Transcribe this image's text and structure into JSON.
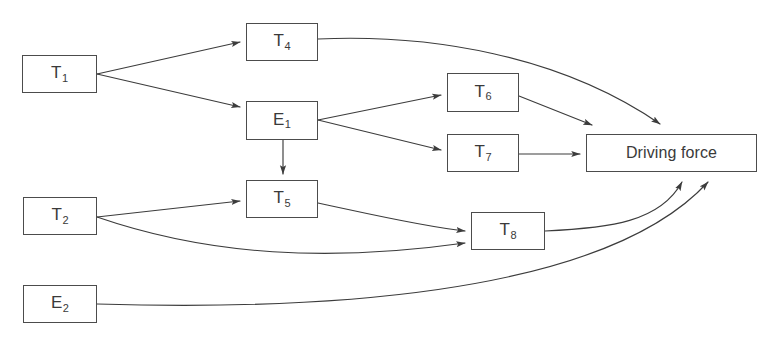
{
  "diagram": {
    "background_color": "#ffffff",
    "line_color": "#3c3c3c",
    "box_border_color": "#4c4c4c",
    "text_color": "#3a3a3a",
    "nodes": [
      {
        "id": "T1",
        "base": "T",
        "sub": "1",
        "label": "T1",
        "x": 22,
        "y": 55,
        "w": 75,
        "h": 38
      },
      {
        "id": "T2",
        "base": "T",
        "sub": "2",
        "label": "T2",
        "x": 23,
        "y": 197,
        "w": 74,
        "h": 38
      },
      {
        "id": "E2",
        "base": "E",
        "sub": "2",
        "label": "E2",
        "x": 23,
        "y": 285,
        "w": 74,
        "h": 38
      },
      {
        "id": "T4",
        "base": "T",
        "sub": "4",
        "label": "T4",
        "x": 246,
        "y": 23,
        "w": 72,
        "h": 38
      },
      {
        "id": "E1",
        "base": "E",
        "sub": "1",
        "label": "E1",
        "x": 246,
        "y": 101,
        "w": 72,
        "h": 39
      },
      {
        "id": "T5",
        "base": "T",
        "sub": "5",
        "label": "T5",
        "x": 246,
        "y": 180,
        "w": 72,
        "h": 38
      },
      {
        "id": "T6",
        "base": "T",
        "sub": "6",
        "label": "T6",
        "x": 447,
        "y": 73,
        "w": 72,
        "h": 39
      },
      {
        "id": "T7",
        "base": "T",
        "sub": "7",
        "label": "T7",
        "x": 447,
        "y": 134,
        "w": 72,
        "h": 38
      },
      {
        "id": "T8",
        "base": "T",
        "sub": "8",
        "label": "T8",
        "x": 471,
        "y": 212,
        "w": 74,
        "h": 38
      },
      {
        "id": "DF",
        "base": "Driving force",
        "sub": "",
        "label": "Driving force",
        "x": 586,
        "y": 134,
        "w": 171,
        "h": 38
      }
    ],
    "edges": [
      {
        "id": "T1-T4",
        "from": "T1",
        "to": "T4",
        "kind": "straight",
        "arrow": true
      },
      {
        "id": "T1-E1",
        "from": "T1",
        "to": "E1",
        "kind": "straight",
        "arrow": true
      },
      {
        "id": "T4-DF",
        "from": "T4",
        "to": "DF",
        "kind": "curve",
        "arrow": true
      },
      {
        "id": "E1-T6",
        "from": "E1",
        "to": "T6",
        "kind": "straight",
        "arrow": true
      },
      {
        "id": "E1-T7",
        "from": "E1",
        "to": "T7",
        "kind": "straight",
        "arrow": true
      },
      {
        "id": "E1-T5",
        "from": "E1",
        "to": "T5",
        "kind": "straight",
        "arrow": true
      },
      {
        "id": "T6-DF",
        "from": "T6",
        "to": "DF",
        "kind": "straight",
        "arrow": true
      },
      {
        "id": "T7-DF",
        "from": "T7",
        "to": "DF",
        "kind": "straight",
        "arrow": true
      },
      {
        "id": "T2-T5",
        "from": "T2",
        "to": "T5",
        "kind": "straight",
        "arrow": true
      },
      {
        "id": "T2-T8",
        "from": "T2",
        "to": "T8",
        "kind": "curve",
        "arrow": true
      },
      {
        "id": "T5-T8",
        "from": "T5",
        "to": "T8",
        "kind": "curve",
        "arrow": true
      },
      {
        "id": "T8-DF",
        "from": "T8",
        "to": "DF",
        "kind": "curve",
        "arrow": true
      },
      {
        "id": "E2-DF",
        "from": "E2",
        "to": "DF",
        "kind": "curve",
        "arrow": true
      }
    ]
  }
}
